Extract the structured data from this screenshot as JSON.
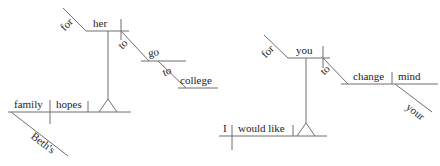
{
  "image": {
    "kind": "sentence-diagram-pair",
    "background_color": "#ffffff",
    "line_color": "#6f6f6f",
    "text_color": "#1d1d1d",
    "width": 440,
    "height": 166
  },
  "diagrams": [
    {
      "id": "left",
      "sentence": "Beth's family hopes for her to go to college.",
      "words": {
        "subject": "family",
        "subject_modifier": "Beth's",
        "verb": "hopes",
        "prep_main": "for",
        "prep_object": "her",
        "infinitive_marker_1": "to",
        "infinitive_verb": "go",
        "infinitive_marker_2": "to",
        "infinitive_object": "college"
      }
    },
    {
      "id": "right",
      "sentence": "I would like for you to change your mind.",
      "words": {
        "subject": "I",
        "verb": "would like",
        "prep_main": "for",
        "prep_object": "you",
        "infinitive_marker": "to",
        "infinitive_verb": "change",
        "infinitive_object": "mind",
        "object_modifier": "your"
      }
    }
  ],
  "labels": {
    "left_for": "for",
    "left_her": "her",
    "left_to_1": "to",
    "left_go": "go",
    "left_to_2": "to",
    "left_college": "college",
    "left_family": "family",
    "left_hopes": "hopes",
    "left_beths": "Beth's",
    "right_for": "for",
    "right_you": "you",
    "right_to": "to",
    "right_change": "change",
    "right_mind": "mind",
    "right_your": "your",
    "right_i": "I",
    "right_would_like": "would like"
  }
}
